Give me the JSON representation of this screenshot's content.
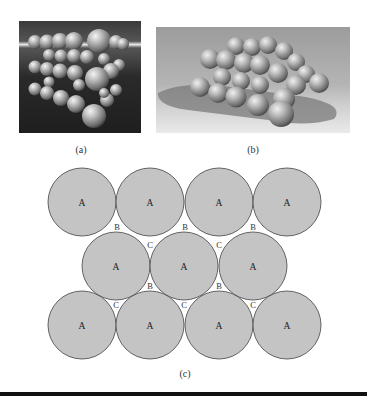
{
  "figure": {
    "panels": [
      {
        "id": "a",
        "caption": "(a)",
        "description": "3D render of stacked spheres in cubic arrangement, dark background"
      },
      {
        "id": "b",
        "caption": "(b)",
        "description": "3D render of close-packed spheres casting shadow on light floor"
      },
      {
        "id": "c",
        "caption": "(c)",
        "description": "2D close-packed layer diagram with A sites and B/C interstitial sites"
      }
    ],
    "diagram_c": {
      "circle_fill": "#c4c4c4",
      "circle_stroke": "#555555",
      "radius": 34,
      "rows": [
        {
          "y": 202,
          "centers_x": [
            82,
            150,
            219,
            287
          ],
          "label": "A"
        },
        {
          "y": 266,
          "centers_x": [
            116,
            184,
            253
          ],
          "label": "A"
        },
        {
          "y": 325,
          "centers_x": [
            82,
            150,
            219,
            287
          ],
          "label": "A"
        }
      ],
      "site_labels": [
        {
          "text": "B",
          "x": 117,
          "y": 227
        },
        {
          "text": "B",
          "x": 185,
          "y": 227
        },
        {
          "text": "B",
          "x": 253,
          "y": 227
        },
        {
          "text": "C",
          "x": 150,
          "y": 245
        },
        {
          "text": "C",
          "x": 219,
          "y": 245
        },
        {
          "text": "B",
          "x": 150,
          "y": 286
        },
        {
          "text": "B",
          "x": 219,
          "y": 286
        },
        {
          "text": "C",
          "x": 116,
          "y": 305
        },
        {
          "text": "C",
          "x": 184,
          "y": 305
        },
        {
          "text": "C",
          "x": 253,
          "y": 305
        }
      ]
    }
  }
}
